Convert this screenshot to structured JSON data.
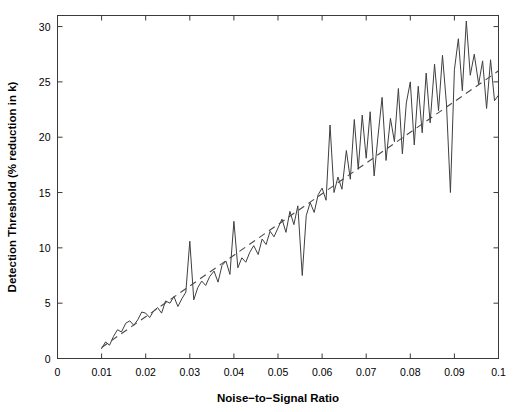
{
  "chart_data": {
    "type": "line",
    "title": "",
    "subtitle": "",
    "xlabel": "Noise−to−Signal Ratio",
    "ylabel": "Detection Threshold (% reduction in k)",
    "xlim": [
      0,
      0.1
    ],
    "ylim": [
      0,
      31
    ],
    "xticks": [
      0,
      0.01,
      0.02,
      0.03,
      0.04,
      0.05,
      0.06,
      0.07,
      0.08,
      0.09,
      0.1
    ],
    "xticklabels": [
      "0",
      "0.01",
      "0.02",
      "0.03",
      "0.04",
      "0.05",
      "0.06",
      "0.07",
      "0.08",
      "0.09",
      "0.1"
    ],
    "yticks": [
      0,
      5,
      10,
      15,
      20,
      25,
      30
    ],
    "yticklabels": [
      "0",
      "5",
      "10",
      "15",
      "20",
      "25",
      "30"
    ],
    "grid": false,
    "legend": null,
    "legend_position": "none",
    "box_frame": true,
    "tick_direction": "in",
    "series": [
      {
        "name": "Detection threshold (simulated)",
        "style": "solid",
        "color": "#3f3f3f",
        "x": [
          0.01,
          0.0109,
          0.0118,
          0.0127,
          0.0136,
          0.0145,
          0.0155,
          0.0164,
          0.0173,
          0.0182,
          0.0191,
          0.02,
          0.0209,
          0.0218,
          0.0227,
          0.0236,
          0.0245,
          0.0255,
          0.0264,
          0.0273,
          0.0282,
          0.0291,
          0.03,
          0.0309,
          0.0318,
          0.0327,
          0.0336,
          0.0345,
          0.0355,
          0.0364,
          0.0373,
          0.0382,
          0.0391,
          0.04,
          0.0409,
          0.0418,
          0.0427,
          0.0436,
          0.0445,
          0.0455,
          0.0464,
          0.0473,
          0.0482,
          0.0491,
          0.05,
          0.0509,
          0.0518,
          0.0527,
          0.0536,
          0.0545,
          0.0555,
          0.0564,
          0.0573,
          0.0582,
          0.0591,
          0.06,
          0.0609,
          0.0618,
          0.0627,
          0.0636,
          0.0645,
          0.0655,
          0.0664,
          0.0673,
          0.0682,
          0.0691,
          0.07,
          0.0709,
          0.0718,
          0.0727,
          0.0736,
          0.0745,
          0.0755,
          0.0764,
          0.0773,
          0.0782,
          0.0791,
          0.08,
          0.0809,
          0.0818,
          0.0827,
          0.0836,
          0.0845,
          0.0855,
          0.0864,
          0.0873,
          0.0882,
          0.0891,
          0.09,
          0.0909,
          0.0918,
          0.0927,
          0.0936,
          0.0945,
          0.0955,
          0.0964,
          0.0973,
          0.0982,
          0.0991,
          0.1
        ],
        "y": [
          0.9,
          1.5,
          1.2,
          2.0,
          2.6,
          2.4,
          3.2,
          3.4,
          3.0,
          3.5,
          4.2,
          4.1,
          3.7,
          4.3,
          4.6,
          4.1,
          5.2,
          5.0,
          5.6,
          4.7,
          5.4,
          6.0,
          10.6,
          5.3,
          6.4,
          7.0,
          6.6,
          7.4,
          7.9,
          6.9,
          8.4,
          8.8,
          7.6,
          12.4,
          8.2,
          9.1,
          8.7,
          9.6,
          10.2,
          9.4,
          10.8,
          10.3,
          11.5,
          11.0,
          11.8,
          12.6,
          11.4,
          13.3,
          12.1,
          13.8,
          7.5,
          12.9,
          14.1,
          13.2,
          14.8,
          15.4,
          14.3,
          21.1,
          15.0,
          16.4,
          15.3,
          18.8,
          16.2,
          21.6,
          17.1,
          22.0,
          18.1,
          22.3,
          16.5,
          20.2,
          23.6,
          17.9,
          21.7,
          19.6,
          24.4,
          18.5,
          23.1,
          25.0,
          19.3,
          24.6,
          20.4,
          25.8,
          21.3,
          26.6,
          22.4,
          27.4,
          23.0,
          15.0,
          26.1,
          28.9,
          24.2,
          30.5,
          25.6,
          27.5,
          24.8,
          26.9,
          22.6,
          27.0,
          23.3,
          23.8
        ]
      },
      {
        "name": "Linear trend",
        "style": "dashed",
        "color": "#4a4a4a",
        "x": [
          0.01,
          0.1
        ],
        "y": [
          1.0,
          26.0
        ]
      }
    ]
  },
  "axes": {
    "x_title": "Noise−to−Signal Ratio",
    "y_title": "Detection Threshold (% reduction in k)"
  }
}
